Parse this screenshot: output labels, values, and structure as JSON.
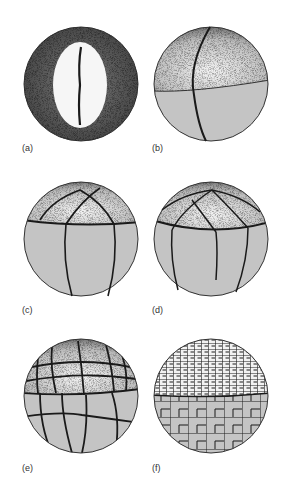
{
  "figure": {
    "colors": {
      "background": "#ffffff",
      "vegetal": "#c4c4c4",
      "animal_stipple": "#6a6a6a",
      "furrow": "#1a1a1a",
      "label": "#333333"
    },
    "panels": [
      {
        "id": "a",
        "label": "(a)"
      },
      {
        "id": "b",
        "label": "(b)"
      },
      {
        "id": "c",
        "label": "(c)"
      },
      {
        "id": "d",
        "label": "(d)"
      },
      {
        "id": "e",
        "label": "(e)"
      },
      {
        "id": "f",
        "label": "(f)"
      }
    ]
  }
}
